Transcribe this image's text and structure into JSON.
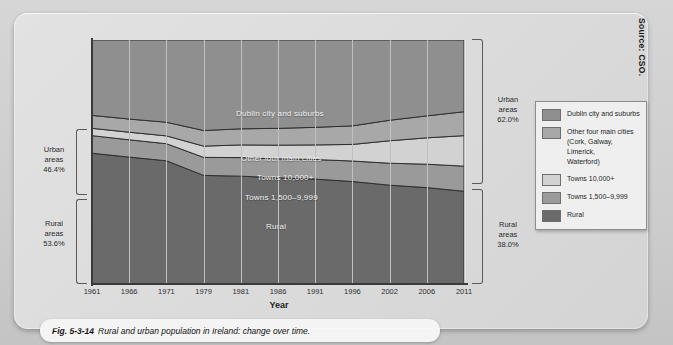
{
  "source_note": "Source: CSO.",
  "caption": {
    "fig_number": "Fig. 5-3-14",
    "text": "Rural and urban population in Ireland: change over time."
  },
  "annotations": {
    "left_urban": "Urban\nareas\n46.4%",
    "left_urban_l1": "Urban",
    "left_urban_l2": "areas",
    "left_urban_l3": "46.4%",
    "left_rural_l1": "Rural",
    "left_rural_l2": "areas",
    "left_rural_l3": "53.6%",
    "right_urban_l1": "Urban",
    "right_urban_l2": "areas",
    "right_urban_l3": "62.0%",
    "right_rural_l1": "Rural",
    "right_rural_l2": "areas",
    "right_rural_l3": "38.0%"
  },
  "band_labels": {
    "dublin": "Dublin city and suburbs",
    "other_cities": "Other four main cities",
    "towns_10000": "Towns 10,000+",
    "towns_1500": "Towns 1,500–9,999",
    "rural": "Rural"
  },
  "legend": {
    "items": [
      {
        "label": "Dublin city and suburbs",
        "color": "#8f8f8f"
      },
      {
        "label": "Other four main cities\n(Cork, Galway, Limerick,\nWaterford)",
        "color": "#a8a8a8"
      },
      {
        "label": "Towns 10,000+",
        "color": "#d2d2d2"
      },
      {
        "label": "Towns 1,500–9,999",
        "color": "#9a9a9a"
      },
      {
        "label": "Rural",
        "color": "#6a6a6a"
      }
    ],
    "item0": "Dublin city and suburbs",
    "item1_l1": "Other four main cities",
    "item1_l2": "(Cork, Galway, Limerick,",
    "item1_l3": "Waterford)",
    "item2": "Towns 10,000+",
    "item3": "Towns 1,500–9,999",
    "item4": "Rural"
  },
  "chart_data": {
    "type": "area",
    "title": "Rural and urban population in Ireland: change over time.",
    "subtitle": "Fig. 5-3-14",
    "xlabel": "Year",
    "ylabel": "",
    "grid": true,
    "legend_position": "right",
    "stacked": true,
    "normalized": true,
    "x": [
      1961,
      1966,
      1971,
      1979,
      1981,
      1986,
      1991,
      1996,
      2002,
      2006,
      2011
    ],
    "categories": [
      "1961",
      "1966",
      "1971",
      "1979",
      "1981",
      "1986",
      "1991",
      "1996",
      "2002",
      "2006",
      "2011"
    ],
    "ylim": [
      0,
      100
    ],
    "series": [
      {
        "name": "Rural",
        "color": "#6a6a6a",
        "values": [
          53.6,
          52.0,
          50.5,
          44.5,
          44.2,
          43.5,
          43.0,
          42.0,
          40.5,
          39.5,
          38.0
        ]
      },
      {
        "name": "Towns 1,500–9,999",
        "color": "#9a9a9a",
        "values": [
          7.2,
          7.1,
          7.0,
          7.4,
          7.6,
          7.8,
          8.0,
          8.4,
          9.0,
          9.6,
          10.3
        ]
      },
      {
        "name": "Towns 10,000+",
        "color": "#d2d2d2",
        "values": [
          3.0,
          3.1,
          3.2,
          4.6,
          5.2,
          5.6,
          6.0,
          6.8,
          9.2,
          10.8,
          12.5
        ]
      },
      {
        "name": "Other four main cities",
        "color": "#a8a8a8",
        "values": [
          5.3,
          5.4,
          5.6,
          6.4,
          6.6,
          6.9,
          7.2,
          7.6,
          8.4,
          9.0,
          9.8
        ]
      },
      {
        "name": "Dublin city and suburbs",
        "color": "#8f8f8f",
        "values": [
          30.9,
          32.4,
          33.7,
          37.1,
          36.4,
          36.2,
          35.8,
          35.2,
          32.9,
          31.1,
          29.4
        ]
      }
    ],
    "bracket_totals": {
      "1961": {
        "urban": 46.4,
        "rural": 53.6
      },
      "2011": {
        "urban": 62.0,
        "rural": 38.0
      }
    }
  }
}
